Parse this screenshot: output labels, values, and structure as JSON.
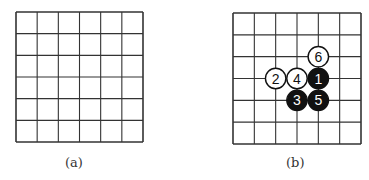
{
  "figures": [
    {
      "id": "a",
      "caption": "(a)",
      "grid": {
        "cols": 6,
        "rows": 6,
        "x0": 16,
        "y0": 12,
        "x1": 143,
        "y1": 142
      },
      "stones": []
    },
    {
      "id": "b",
      "caption": "(b)",
      "grid": {
        "cols": 6,
        "rows": 6,
        "x0": 233,
        "y0": 13,
        "x1": 361,
        "y1": 144
      },
      "stones": [
        {
          "label": "1",
          "color": "black",
          "col": 4,
          "row": 3
        },
        {
          "label": "2",
          "color": "white",
          "col": 2,
          "row": 3
        },
        {
          "label": "3",
          "color": "black",
          "col": 3,
          "row": 4
        },
        {
          "label": "4",
          "color": "white",
          "col": 3,
          "row": 3
        },
        {
          "label": "5",
          "color": "black",
          "col": 4,
          "row": 4
        },
        {
          "label": "6",
          "color": "white",
          "col": 4,
          "row": 2
        }
      ]
    }
  ],
  "colors": {
    "line": "#333333",
    "black_stone": "#111111",
    "white_stone": "#ffffff"
  }
}
